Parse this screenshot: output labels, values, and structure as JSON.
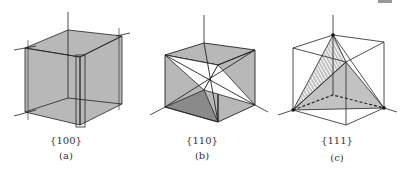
{
  "figure": {
    "panels": [
      {
        "id": "a",
        "plane_family": "{100}",
        "caption": "(a)",
        "description": "cube with hatched {100} faces"
      },
      {
        "id": "b",
        "plane_family": "{110}",
        "caption": "(b)",
        "description": "cube with hatched {110} diagonal planes"
      },
      {
        "id": "c",
        "plane_family": "{111}",
        "caption": "(c)",
        "description": "cube with hatched {111} tetrahedral planes"
      }
    ],
    "colors": {
      "line": "#222222",
      "background": "#ffffff"
    }
  }
}
